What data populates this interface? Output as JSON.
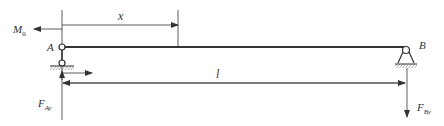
{
  "diagram": {
    "type": "simply-supported-beam",
    "labels": {
      "moment": "M",
      "moment_sub": "0",
      "support_a": "A",
      "support_b": "B",
      "position": "x",
      "length": "l",
      "reaction_a": "F",
      "reaction_a_sub": "Ay",
      "reaction_b": "F",
      "reaction_b_sub": "By"
    },
    "colors": {
      "line": "#333333",
      "background": "#ffffff"
    }
  }
}
